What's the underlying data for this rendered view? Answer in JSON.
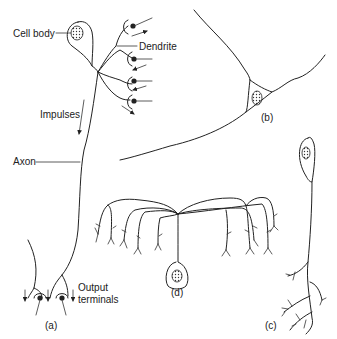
{
  "diagram": {
    "labels": {
      "cell_body": "Cell body",
      "dendrite": "Dendrite",
      "impulses": "Impulses",
      "axon": "Axon",
      "output_terminals_line1": "Output",
      "output_terminals_line2": "terminals"
    },
    "panels": {
      "a": "(a)",
      "b": "(b)",
      "c": "(c)",
      "d": "(d)"
    },
    "colors": {
      "line": "#222222",
      "background": "#ffffff"
    }
  }
}
